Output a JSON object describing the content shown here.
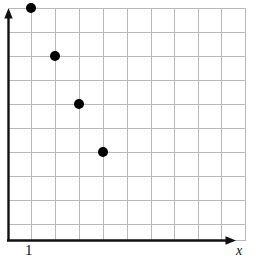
{
  "figure": {
    "kind": "coordinate-grid-scatter",
    "background_color": "#ffffff",
    "axis_color": "#111111",
    "grid_color": "#b8b8b8",
    "point_color": "#000000"
  },
  "labels": {
    "x_origin_tick": "1",
    "x_axis_name": "x"
  },
  "chart_data": {
    "type": "scatter",
    "title": "",
    "xlabel": "x",
    "ylabel": "",
    "grid": true,
    "legend": null,
    "xlim": [
      0,
      10
    ],
    "ylim": [
      0,
      10
    ],
    "xticks": [
      1
    ],
    "xticklabels": [
      "1"
    ],
    "yticks": [],
    "yticklabels": [],
    "series": [
      {
        "name": "points",
        "marker": "filled-circle",
        "color": "#000000",
        "points": [
          {
            "x": 1,
            "y": 10
          },
          {
            "x": 2,
            "y": 8
          },
          {
            "x": 3,
            "y": 6
          },
          {
            "x": 4,
            "y": 4
          }
        ]
      }
    ]
  },
  "geometry": {
    "grid_left": 8,
    "grid_top": 8,
    "grid_right": 245,
    "grid_bottom": 240,
    "cell_size": 23.7,
    "columns": 10,
    "rows": 10,
    "point_radius": 5,
    "pixel_points": [
      {
        "cx": 31,
        "cy": 8
      },
      {
        "cx": 55,
        "cy": 56
      },
      {
        "cx": 79,
        "cy": 104
      },
      {
        "cx": 103,
        "cy": 152
      }
    ]
  }
}
